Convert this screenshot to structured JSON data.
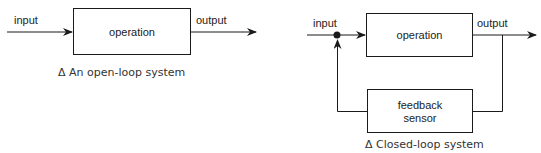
{
  "open_loop": {
    "input_label": "input",
    "operation_label": "operation",
    "output_label": "output",
    "caption": "Δ An open-loop system"
  },
  "closed_loop": {
    "input_label": "input",
    "operation_label": "operation",
    "output_label": "output",
    "feedback_label_line1": "feedback",
    "feedback_label_line2": "sensor",
    "caption": "Δ Closed-loop system"
  },
  "colors": {
    "line": "#1a1a1a",
    "text": "#222222",
    "background": "#ffffff"
  }
}
